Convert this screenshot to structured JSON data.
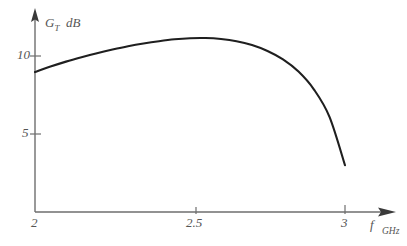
{
  "chart_data": {
    "type": "line",
    "title": "",
    "subtitle": "",
    "xlabel": "f",
    "xunit": "GHz",
    "ylabel": "G_T",
    "yunit": "dB",
    "ylabel_main": "G",
    "ylabel_sub": "T",
    "xlim": [
      2,
      3
    ],
    "ylim": [
      0,
      12.5
    ],
    "grid": false,
    "legend": null,
    "x_ticks": [
      2,
      2.5,
      3
    ],
    "x_tick_labels": [
      "2",
      "2.5",
      "3"
    ],
    "y_ticks": [
      5,
      10
    ],
    "y_tick_labels": [
      "5",
      "10"
    ],
    "axis_arrows": true,
    "line_color": "#1f1f1f",
    "axis_color": "#6a6a6a",
    "background": "#ffffff",
    "series": [
      {
        "name": "Transducer gain",
        "x": [
          2.0,
          2.05,
          2.1,
          2.15,
          2.2,
          2.25,
          2.3,
          2.35,
          2.4,
          2.45,
          2.5,
          2.55,
          2.6,
          2.65,
          2.7,
          2.75,
          2.8,
          2.85,
          2.9,
          2.95,
          3.0
        ],
        "values": [
          8.97,
          9.32,
          9.64,
          9.92,
          10.18,
          10.41,
          10.62,
          10.8,
          10.95,
          11.07,
          11.14,
          11.15,
          11.09,
          10.95,
          10.7,
          10.32,
          9.78,
          9.0,
          7.85,
          6.1,
          3.0
        ]
      }
    ],
    "annotations": [
      {
        "text": "G_T dB",
        "role": "y-axis-title"
      },
      {
        "text": "f GHz",
        "role": "x-axis-title"
      }
    ]
  }
}
